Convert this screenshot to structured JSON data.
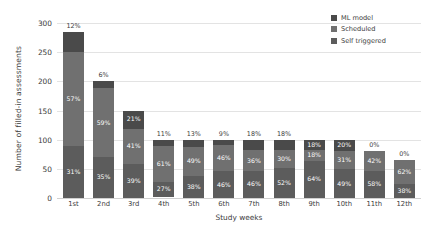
{
  "chart_data": {
    "type": "bar",
    "title": "",
    "xlabel": "Study weeks",
    "ylabel": "Number of filled-in assessments",
    "ylim": [
      0,
      300
    ],
    "yticks": [
      0,
      50,
      100,
      150,
      200,
      250,
      300
    ],
    "grid": true,
    "stacked": true,
    "legend_position": "top-right",
    "categories": [
      "1st",
      "2nd",
      "3rd",
      "4th",
      "5th",
      "6th",
      "7th",
      "8th",
      "9th",
      "10th",
      "11th",
      "12th"
    ],
    "totals": [
      285,
      200,
      150,
      100,
      100,
      100,
      100,
      100,
      100,
      100,
      80,
      65
    ],
    "series": [
      {
        "name": "Self triggered",
        "color": "#5c5c5c",
        "values": [
          31,
          35,
          39,
          27,
          38,
          46,
          46,
          52,
          64,
          49,
          58,
          38
        ],
        "labels": [
          "31%",
          "35%",
          "39%",
          "27%",
          "38%",
          "46%",
          "46%",
          "52%",
          "64%",
          "49%",
          "58%",
          "38%"
        ]
      },
      {
        "name": "Scheduled",
        "color": "#707070",
        "values": [
          57,
          59,
          41,
          61,
          49,
          46,
          36,
          30,
          18,
          31,
          42,
          62
        ],
        "labels": [
          "57%",
          "59%",
          "41%",
          "61%",
          "49%",
          "46%",
          "36%",
          "30%",
          "18%",
          "31%",
          "42%",
          "62%"
        ]
      },
      {
        "name": "ML model",
        "color": "#4a4a4a",
        "values": [
          12,
          6,
          21,
          11,
          13,
          9,
          18,
          18,
          18,
          20,
          0,
          0
        ],
        "labels": [
          "12%",
          "6%",
          "21%",
          "11%",
          "13%",
          "9%",
          "18%",
          "18%",
          "18%",
          "20%",
          "0%",
          "0%"
        ]
      }
    ],
    "top_labels": [
      "12%",
      "6%",
      "21%",
      "11%",
      "13%",
      "9%",
      "18%",
      "18%",
      "18%",
      "20%",
      "0%",
      "0%"
    ],
    "top_label_outside": [
      true,
      true,
      false,
      true,
      true,
      true,
      true,
      true,
      false,
      false,
      true,
      true
    ]
  },
  "legend": {
    "items": [
      {
        "label": "ML model",
        "color": "#4a4a4a"
      },
      {
        "label": "Scheduled",
        "color": "#707070"
      },
      {
        "label": "Self triggered",
        "color": "#5c5c5c"
      }
    ]
  }
}
